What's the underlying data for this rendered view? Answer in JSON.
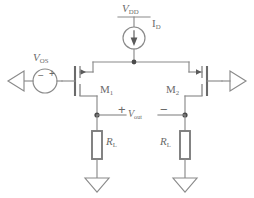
{
  "diagram": {
    "type": "circuit-schematic",
    "width": 254,
    "height": 198
  },
  "labels": {
    "supply": {
      "symbol": "V",
      "subscript": "DD"
    },
    "bias_current": {
      "symbol": "I",
      "subscript": "D"
    },
    "offset_source": {
      "symbol": "V",
      "subscript": "OS"
    },
    "transistor_1": {
      "symbol": "M",
      "subscript": "1"
    },
    "transistor_2": {
      "symbol": "M",
      "subscript": "2"
    },
    "output_voltage": {
      "symbol": "V",
      "subscript": "out"
    },
    "load_resistor_left": {
      "symbol": "R",
      "subscript": "L"
    },
    "load_resistor_right": {
      "symbol": "R",
      "subscript": "L"
    }
  },
  "polarity": {
    "output_positive": "+",
    "output_negative": "−",
    "source_negative": "−",
    "source_positive": "+"
  },
  "nodes": {
    "tail_node": "current source output rail",
    "out_node_left": "left output node",
    "out_node_right": "right output node"
  },
  "terminals": {
    "left_input": "left-pointing-terminal",
    "right_output": "right-pointing-terminal"
  },
  "grounds": {
    "left": "ground-triangle",
    "right": "ground-triangle"
  },
  "colors": {
    "wire": "#8a8a8a",
    "device": "#7a7a7a",
    "text": "#6a6a6a",
    "node": "#4a4a4a",
    "background": "#ffffff"
  }
}
